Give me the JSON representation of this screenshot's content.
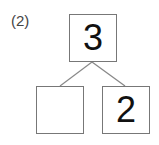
{
  "problem_label": "(2)",
  "number_bond": {
    "whole": "3",
    "parts": [
      "",
      "2"
    ]
  }
}
